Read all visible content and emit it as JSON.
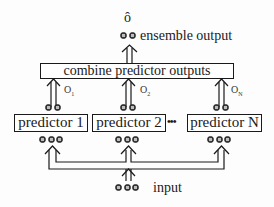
{
  "diagram": {
    "output_symbol": "ô",
    "output_label": "ensemble output",
    "combine_label": "combine predictor outputs",
    "input_label": "input",
    "ellipsis": "•••",
    "predictors": [
      {
        "label": "predictor 1",
        "output": "O",
        "output_sub": "1"
      },
      {
        "label": "predictor 2",
        "output": "O",
        "output_sub": "2"
      },
      {
        "label": "predictor N",
        "output": "O",
        "output_sub": "N"
      }
    ],
    "colors": {
      "line": "#1a1a1a",
      "background": "#fdfdfd"
    }
  }
}
